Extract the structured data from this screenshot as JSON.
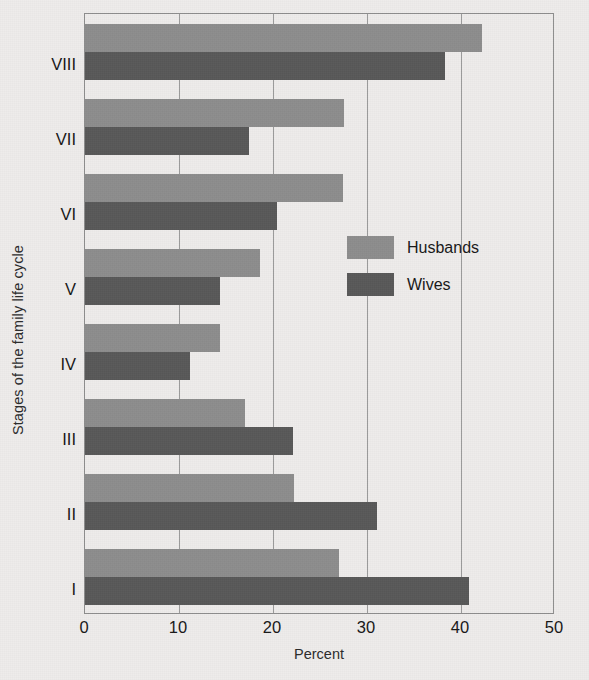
{
  "chart_data": {
    "type": "bar",
    "orientation": "horizontal",
    "title": "",
    "xlabel": "Percent",
    "ylabel": "Stages of the family life cycle",
    "categories": [
      "VIII",
      "VII",
      "VI",
      "V",
      "IV",
      "III",
      "II",
      "I"
    ],
    "category_order_top_to_bottom": [
      "VIII",
      "VII",
      "VI",
      "V",
      "IV",
      "III",
      "II",
      "I"
    ],
    "series": [
      {
        "name": "Husbands",
        "color": "#8d8d8d",
        "values": [
          42.2,
          27.5,
          27.4,
          18.6,
          14.4,
          17.0,
          22.2,
          27.0
        ]
      },
      {
        "name": "Wives",
        "color": "#585858",
        "values": [
          38.3,
          17.4,
          20.4,
          14.4,
          11.2,
          22.1,
          31.1,
          40.9
        ]
      }
    ],
    "xlim": [
      0,
      50
    ],
    "xticks": [
      0,
      10,
      20,
      30,
      40,
      50
    ],
    "xtick_labels": [
      "0",
      "10",
      "20",
      "30",
      "40",
      "50"
    ],
    "grid": "vertical",
    "legend_position": "inside-center-right"
  },
  "legend": {
    "items": [
      {
        "label": "Husbands",
        "color": "#8d8d8d"
      },
      {
        "label": "Wives",
        "color": "#585858"
      }
    ]
  },
  "colors": {
    "background": "#eeeceb",
    "frame": "#8e8e8e",
    "gridline": "#9a9a9a",
    "husbands": "#8d8d8d",
    "wives": "#585858",
    "text": "#171717"
  }
}
